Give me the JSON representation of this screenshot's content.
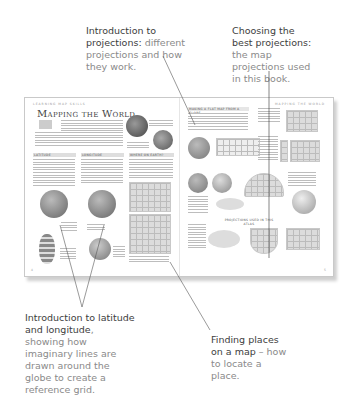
{
  "callouts": [
    {
      "id": "projections-intro",
      "bold": "Introduction to projections:",
      "rest": " different projections and how they work."
    },
    {
      "id": "best-projections",
      "bold": "Choosing the best projections:",
      "rest": " the map projections used in this book."
    },
    {
      "id": "latitude-longitude",
      "bold": "Introduction to latitude and longitude",
      "rest": ", showing how imaginary lines are drawn around the globe to create a reference grid."
    },
    {
      "id": "finding-places",
      "bold": "Finding places on a map",
      "rest": " – how to locate a place."
    }
  ],
  "book": {
    "left_page": {
      "running_head": "LEARNING MAP SKILLS",
      "title": "Mapping the World",
      "sections": [
        "LATITUDE",
        "LONGITUDE",
        "WHERE ON EARTH?"
      ],
      "page_number": "4"
    },
    "right_page": {
      "running_head": "MAPPING THE WORLD",
      "heading": "MAKING A FLAT MAP FROM A GLOBE",
      "subheading": "PROJECTIONS USED IN THIS ATLAS",
      "page_number": "5"
    }
  }
}
